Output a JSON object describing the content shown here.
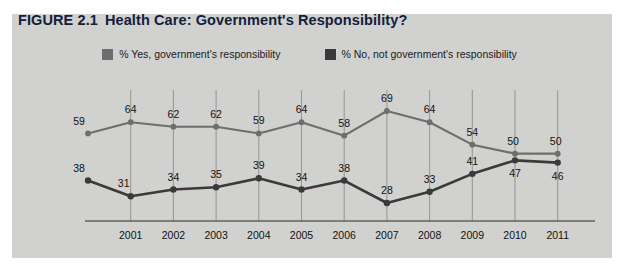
{
  "figure": {
    "number": "FIGURE 2.1",
    "title": "Health Care: Government's Responsibility?",
    "panel_color": "#d1d1cf",
    "page_background": "#ffffff"
  },
  "legend": {
    "position": "top-center",
    "items": [
      {
        "label": "% Yes, government's responsibility",
        "color": "#6e6e6e"
      },
      {
        "label": "% No, not government's responsibility",
        "color": "#3a3a3a"
      }
    ]
  },
  "chart_data": {
    "type": "line",
    "title": "Health Care: Government's Responsibility?",
    "xlabel": "",
    "ylabel": "",
    "ylim": [
      20,
      75
    ],
    "grid": "vertical",
    "legend_position": "top-center",
    "x": [
      2000,
      2001,
      2002,
      2003,
      2004,
      2005,
      2006,
      2007,
      2008,
      2009,
      2010,
      2011
    ],
    "tick_labels": [
      "",
      "2001",
      "2002",
      "2003",
      "2004",
      "2005",
      "2006",
      "2007",
      "2008",
      "2009",
      "2010",
      "2011"
    ],
    "series": [
      {
        "name": "% Yes, government's responsibility",
        "color": "#6e6e6e",
        "values": [
          59,
          64,
          62,
          62,
          59,
          64,
          58,
          69,
          64,
          54,
          50,
          50
        ],
        "label_position": "above"
      },
      {
        "name": "% No, not government's responsibility",
        "color": "#3a3a3a",
        "values": [
          38,
          31,
          34,
          35,
          39,
          34,
          38,
          28,
          33,
          41,
          47,
          46
        ],
        "label_position": "above"
      }
    ]
  }
}
